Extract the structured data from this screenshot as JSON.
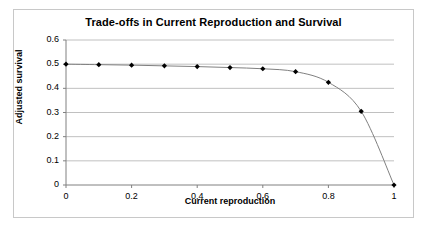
{
  "chart_data": {
    "type": "line",
    "title": "Trade-offs in Current Reproduction and Survival",
    "xlabel": "Current reproduction",
    "ylabel": "Adjusted survival",
    "xlim": [
      0,
      1
    ],
    "ylim": [
      0,
      0.6
    ],
    "grid": "horizontal",
    "legend": "none",
    "marker": "diamond",
    "marker_color": "#000000",
    "line_color": "#808080",
    "gridline_color": "#c0c0c0",
    "background_color": "#ffffff",
    "border_color": "#c8c8c8",
    "x": [
      0,
      0.1,
      0.2,
      0.3,
      0.4,
      0.5,
      0.6,
      0.7,
      0.8,
      0.9,
      1
    ],
    "values": [
      0.5,
      0.498,
      0.496,
      0.493,
      0.49,
      0.486,
      0.481,
      0.469,
      0.425,
      0.305,
      0
    ],
    "xticks": [
      0,
      0.2,
      0.4,
      0.6,
      0.8,
      1
    ],
    "xtick_labels": [
      "0",
      "0.2",
      "0.4",
      "0.6",
      "0.8",
      "1"
    ],
    "yticks": [
      0,
      0.1,
      0.2,
      0.3,
      0.4,
      0.5,
      0.6
    ],
    "ytick_labels": [
      "0",
      "0.1",
      "0.2",
      "0.3",
      "0.4",
      "0.5",
      "0.6"
    ]
  }
}
